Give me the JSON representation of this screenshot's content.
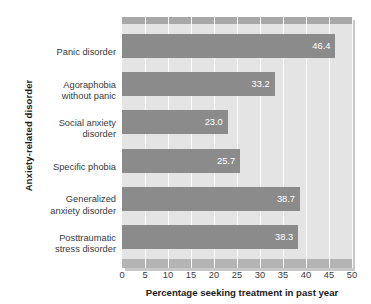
{
  "chart_data": {
    "type": "bar",
    "orientation": "horizontal",
    "title": "",
    "xlabel": "Percentage seeking treatment in past year",
    "ylabel": "Anxiety-related disorder",
    "categories": [
      "Panic disorder",
      "Agoraphobia without panic",
      "Social anxiety disorder",
      "Specific phobia",
      "Generalized anxiety disorder",
      "Posttraumatic stress disorder"
    ],
    "category_lines": [
      [
        "Panic disorder"
      ],
      [
        "Agoraphobia",
        "without panic"
      ],
      [
        "Social anxiety",
        "disorder"
      ],
      [
        "Specific phobia"
      ],
      [
        "Generalized",
        "anxiety disorder"
      ],
      [
        "Posttraumatic",
        "stress disorder"
      ]
    ],
    "values": [
      46.4,
      33.2,
      23.0,
      25.7,
      38.7,
      38.3
    ],
    "value_labels": [
      "46.4",
      "33.2",
      "23.0",
      "25.7",
      "38.7",
      "38.3"
    ],
    "xlim": [
      0,
      50
    ],
    "xticks": [
      0,
      5,
      10,
      15,
      20,
      25,
      30,
      35,
      40,
      45,
      50
    ],
    "xtick_labels": [
      "0",
      "5",
      "10",
      "15",
      "20",
      "25",
      "30",
      "35",
      "40",
      "45",
      "50"
    ],
    "grid": "vertical",
    "legend": "none",
    "colors": {
      "bar": "#8b8b8b",
      "plot_background": "#e4e4e4",
      "gridline": "#fbfbfb",
      "band_top": "#a8a8a8",
      "band_bottom": "#b4b4b4",
      "value_label": "#ffffff",
      "tick_label": "#3a3a3a",
      "axis_title": "#1c1c1c",
      "page_background": "#ffffff"
    }
  }
}
